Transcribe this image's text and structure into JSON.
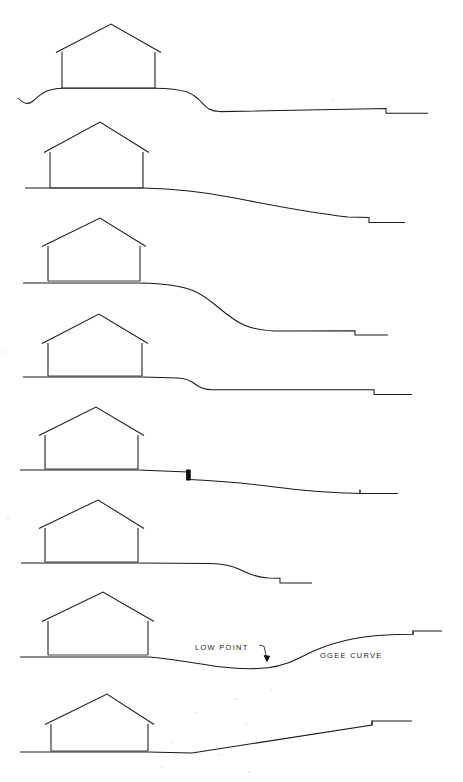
{
  "sheet": {
    "title": "Site Section Studies",
    "background_color": "#ffffff",
    "ink_color": "#1a1a1a",
    "width": 463,
    "height": 782
  },
  "annotations": [
    {
      "id": "low-point",
      "label": "LOW POINT",
      "x": 195,
      "y": 650,
      "has_leader_arrow": true,
      "arrow_from_x": 262,
      "arrow_from_y": 646,
      "arrow_to_x": 267,
      "arrow_to_y": 661
    },
    {
      "id": "ogee-curve",
      "label": "OGEE CURVE",
      "x": 320,
      "y": 658,
      "has_leader_arrow": false
    }
  ],
  "sections": [
    {
      "id": "section-1",
      "index": 1,
      "name": "crowned-knoll-with-dropoff",
      "grade_description": "Ground rises from left swale onto a knoll under the house, then falls in an ogee to a long gentle slope ending at a stepped-down terrace.",
      "house": {
        "left_wall_x": 62,
        "right_wall_x": 155,
        "base_y": 88,
        "eave_y": 52,
        "ridge_x": 111,
        "ridge_y": 24,
        "eave_overhang": 6
      },
      "end_step": {
        "x": 386,
        "drop": 5,
        "direction": "down"
      }
    },
    {
      "id": "section-2",
      "index": 2,
      "name": "gentle-continuous-falling-grade",
      "grade_description": "Flat pad at house, then a long continuous gentle fall to the right, terminating in a small step down.",
      "house": {
        "left_wall_x": 50,
        "right_wall_x": 143,
        "base_y": 188,
        "eave_y": 152,
        "ridge_x": 100,
        "ridge_y": 122,
        "eave_overhang": 6
      },
      "end_step": {
        "x": 369,
        "drop": 5,
        "direction": "down"
      }
    },
    {
      "id": "section-3",
      "index": 3,
      "name": "steep-ogee-drop",
      "grade_description": "Level pad at house, then a pronounced reverse-curve (ogee) dropping steeply to a lower terrace with a step.",
      "house": {
        "left_wall_x": 48,
        "right_wall_x": 140,
        "base_y": 281,
        "eave_y": 246,
        "ridge_x": 100,
        "ridge_y": 218,
        "eave_overhang": 6
      },
      "end_step": {
        "x": 355,
        "drop": 5,
        "direction": "down"
      }
    },
    {
      "id": "section-4",
      "index": 4,
      "name": "short-transition-to-flat-shelf",
      "grade_description": "Level pad, a short rounded transition dropping a small amount, then a nearly flat shelf running far right to a terminal step.",
      "house": {
        "left_wall_x": 48,
        "right_wall_x": 142,
        "base_y": 376,
        "eave_y": 343,
        "ridge_x": 99,
        "ridge_y": 314,
        "eave_overhang": 6
      },
      "end_step": {
        "x": 374,
        "drop": 5,
        "direction": "down"
      }
    },
    {
      "id": "section-5",
      "index": 5,
      "name": "retaining-wall-step",
      "grade_description": "Level pad, a slight fall, then a solid vertical retaining wall drop, then a gentle falling grade to a small end step.",
      "house": {
        "left_wall_x": 45,
        "right_wall_x": 138,
        "base_y": 469,
        "eave_y": 435,
        "ridge_x": 96,
        "ridge_y": 407,
        "eave_overhang": 6
      },
      "retaining_wall": {
        "x": 188,
        "top_y": 469,
        "bottom_y": 479,
        "thickness": 4
      },
      "end_step": {
        "x": 360,
        "drop": 4,
        "direction": "down"
      }
    },
    {
      "id": "section-6",
      "index": 6,
      "name": "short-falling-grade-near-terminus",
      "grade_description": "Level pad, flat apron, then a rounded fall to a short lower terrace ending early with a step.",
      "house": {
        "left_wall_x": 45,
        "right_wall_x": 138,
        "base_y": 562,
        "eave_y": 528,
        "ridge_x": 98,
        "ridge_y": 500,
        "eave_overhang": 6
      },
      "end_step": {
        "x": 280,
        "drop": 5,
        "direction": "down"
      }
    },
    {
      "id": "section-7",
      "index": 7,
      "name": "valley-low-point-and-ogee-rise",
      "grade_description": "Level pad, grade dips to a marked low point, then rises in an ogee curve up to a high terrace at the right.",
      "house": {
        "left_wall_x": 48,
        "right_wall_x": 148,
        "base_y": 655,
        "eave_y": 621,
        "ridge_x": 103,
        "ridge_y": 592,
        "eave_overhang": 6
      },
      "end_step": {
        "x": 413,
        "drop": 4,
        "direction": "up"
      }
    },
    {
      "id": "section-8",
      "index": 8,
      "name": "straight-uphill-ramp",
      "grade_description": "Level pad, short flat apron, then a straight constant-slope ramp rising to a small stepped terrace at the right.",
      "house": {
        "left_wall_x": 51,
        "right_wall_x": 148,
        "base_y": 751,
        "eave_y": 724,
        "ridge_x": 107,
        "ridge_y": 694,
        "eave_overhang": 6
      },
      "end_step": {
        "x": 372,
        "drop": 4,
        "direction": "up"
      }
    }
  ]
}
